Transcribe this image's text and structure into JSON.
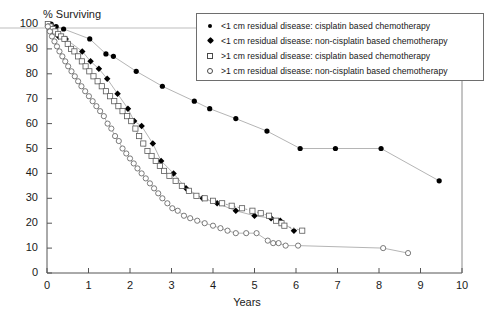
{
  "chart_data": {
    "type": "line",
    "title": "",
    "ylabel": "% Surviving",
    "xlabel": "Years",
    "xlim": [
      0,
      10
    ],
    "ylim": [
      0,
      100
    ],
    "xticks": [
      0,
      1,
      2,
      3,
      4,
      5,
      6,
      7,
      8,
      9,
      10
    ],
    "yticks": [
      0,
      10,
      20,
      30,
      40,
      50,
      60,
      70,
      80,
      90,
      100
    ],
    "grid": false,
    "legend_position": "top-right",
    "legend": [
      "<1 cm  residual disease: cisplatin based chemotherapy",
      "<1 cm  residual disease: non-cisplatin based chemotherapy",
      ">1 cm  residual disease: cisplatin based chemotherapy",
      ">1 cm  residual disease: non-cisplatin based chemotherapy"
    ],
    "series": [
      {
        "name": "<1 cm  residual disease: cisplatin based chemotherapy",
        "marker": "filled-circle",
        "line": "solid",
        "color": "#000000",
        "points": [
          [
            0.02,
            100
          ],
          [
            0.1,
            100
          ],
          [
            0.22,
            99
          ],
          [
            0.4,
            98
          ],
          [
            1.03,
            94
          ],
          [
            1.42,
            88
          ],
          [
            1.6,
            87
          ],
          [
            2.15,
            81
          ],
          [
            2.78,
            75
          ],
          [
            3.55,
            69
          ],
          [
            3.92,
            66
          ],
          [
            4.55,
            62
          ],
          [
            5.3,
            57
          ],
          [
            6.1,
            50
          ],
          [
            6.95,
            50
          ],
          [
            8.05,
            50
          ],
          [
            9.45,
            37
          ]
        ]
      },
      {
        "name": "<1 cm  residual disease: non-cisplatin based chemotherapy",
        "marker": "filled-diamond",
        "line": "solid",
        "color": "#000000",
        "points": [
          [
            0.03,
            99
          ],
          [
            0.15,
            97
          ],
          [
            0.28,
            95
          ],
          [
            0.45,
            94
          ],
          [
            0.85,
            89
          ],
          [
            1.05,
            85
          ],
          [
            1.25,
            82
          ],
          [
            1.45,
            78
          ],
          [
            1.7,
            72
          ],
          [
            1.95,
            66
          ],
          [
            2.1,
            61
          ],
          [
            2.28,
            59
          ],
          [
            2.55,
            52
          ],
          [
            2.75,
            45
          ],
          [
            3.05,
            40
          ],
          [
            3.35,
            34
          ],
          [
            3.75,
            30
          ],
          [
            4.1,
            28
          ],
          [
            4.55,
            25
          ],
          [
            5.0,
            23
          ],
          [
            5.4,
            22
          ],
          [
            5.62,
            21
          ],
          [
            5.95,
            17
          ]
        ]
      },
      {
        "name": ">1 cm  residual disease: cisplatin based chemotherapy",
        "marker": "open-square",
        "line": "dashed",
        "color": "#4a4a4a",
        "points": [
          [
            0.02,
            100
          ],
          [
            0.08,
            99
          ],
          [
            0.14,
            98
          ],
          [
            0.2,
            97
          ],
          [
            0.27,
            96
          ],
          [
            0.34,
            95
          ],
          [
            0.42,
            94
          ],
          [
            0.5,
            92
          ],
          [
            0.58,
            90
          ],
          [
            0.66,
            89
          ],
          [
            0.75,
            87
          ],
          [
            0.84,
            85
          ],
          [
            0.93,
            83
          ],
          [
            1.02,
            81
          ],
          [
            1.12,
            79
          ],
          [
            1.22,
            77
          ],
          [
            1.32,
            75
          ],
          [
            1.42,
            73
          ],
          [
            1.52,
            71
          ],
          [
            1.62,
            69
          ],
          [
            1.72,
            67
          ],
          [
            1.82,
            65
          ],
          [
            1.93,
            63
          ],
          [
            2.03,
            61
          ],
          [
            2.13,
            58
          ],
          [
            2.22,
            55
          ],
          [
            2.32,
            52
          ],
          [
            2.42,
            49
          ],
          [
            2.52,
            47
          ],
          [
            2.62,
            45
          ],
          [
            2.72,
            43
          ],
          [
            2.82,
            41
          ],
          [
            2.95,
            39
          ],
          [
            3.1,
            37
          ],
          [
            3.25,
            35
          ],
          [
            3.42,
            33
          ],
          [
            3.6,
            31
          ],
          [
            3.8,
            30
          ],
          [
            4.0,
            29
          ],
          [
            4.22,
            28
          ],
          [
            4.45,
            27
          ],
          [
            4.7,
            26
          ],
          [
            4.95,
            25
          ],
          [
            5.15,
            24
          ],
          [
            5.35,
            23
          ],
          [
            5.52,
            21
          ],
          [
            5.65,
            20
          ],
          [
            5.72,
            19
          ],
          [
            6.15,
            17
          ]
        ]
      },
      {
        "name": ">1 cm  residual disease: non-cisplatin based chemotherapy",
        "marker": "open-circle",
        "line": "solid",
        "color": "#4a4a4a",
        "points": [
          [
            0.02,
            99
          ],
          [
            0.07,
            97
          ],
          [
            0.12,
            95
          ],
          [
            0.18,
            93
          ],
          [
            0.24,
            91
          ],
          [
            0.3,
            89
          ],
          [
            0.37,
            87
          ],
          [
            0.44,
            85
          ],
          [
            0.51,
            83
          ],
          [
            0.59,
            81
          ],
          [
            0.67,
            79
          ],
          [
            0.75,
            77
          ],
          [
            0.83,
            75
          ],
          [
            0.92,
            73
          ],
          [
            1.01,
            71
          ],
          [
            1.1,
            69
          ],
          [
            1.19,
            67
          ],
          [
            1.28,
            65
          ],
          [
            1.37,
            63
          ],
          [
            1.46,
            60
          ],
          [
            1.55,
            58
          ],
          [
            1.64,
            55
          ],
          [
            1.73,
            53
          ],
          [
            1.82,
            50
          ],
          [
            1.91,
            48
          ],
          [
            2.0,
            46
          ],
          [
            2.09,
            44
          ],
          [
            2.18,
            42
          ],
          [
            2.28,
            40
          ],
          [
            2.38,
            38
          ],
          [
            2.48,
            36
          ],
          [
            2.58,
            34
          ],
          [
            2.68,
            32
          ],
          [
            2.78,
            30
          ],
          [
            2.9,
            28
          ],
          [
            3.02,
            26
          ],
          [
            3.15,
            25
          ],
          [
            3.3,
            23
          ],
          [
            3.45,
            22
          ],
          [
            3.62,
            21
          ],
          [
            3.8,
            20
          ],
          [
            4.0,
            19
          ],
          [
            4.18,
            18
          ],
          [
            4.35,
            17
          ],
          [
            4.55,
            16
          ],
          [
            4.8,
            16
          ],
          [
            5.05,
            16
          ],
          [
            5.32,
            13
          ],
          [
            5.45,
            12
          ],
          [
            5.58,
            12
          ],
          [
            5.75,
            11
          ],
          [
            6.05,
            11
          ],
          [
            8.1,
            10
          ],
          [
            8.7,
            8
          ]
        ]
      }
    ]
  }
}
